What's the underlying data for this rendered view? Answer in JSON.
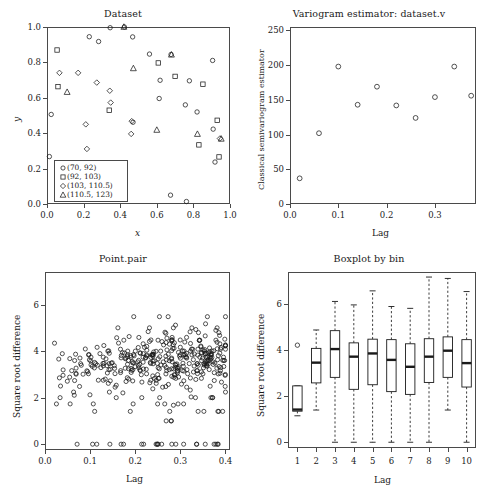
{
  "figure": {
    "width": 492,
    "height": 491,
    "background": "#ffffff",
    "ink": "#1a1a1a"
  },
  "panels": {
    "dataset": {
      "title": "Dataset",
      "xlabel": "x",
      "ylabel": "y",
      "xticks": [
        "0.0",
        "0.2",
        "0.4",
        "0.6",
        "0.8",
        "1.0"
      ],
      "yticks": [
        "0.0",
        "0.2",
        "0.4",
        "0.6",
        "0.8",
        "1.0"
      ],
      "legend_title": "",
      "legend": [
        {
          "label": "(70, 92)",
          "symbol": "circle"
        },
        {
          "label": "(92, 103)",
          "symbol": "square"
        },
        {
          "label": "(103, 110.5)",
          "symbol": "diamond"
        },
        {
          "label": "(110.5, 123)",
          "symbol": "triangle"
        }
      ]
    },
    "variogram": {
      "title": "Variogram estimator: dataset.v",
      "xlabel": "Lag",
      "ylabel": "Classical semivariogram estimator",
      "xticks": [
        "0.0",
        "0.1",
        "0.2",
        "0.3"
      ],
      "yticks": [
        "0",
        "50",
        "100",
        "150",
        "200",
        "250"
      ]
    },
    "pointpair": {
      "title": "Point.pair",
      "xlabel": "Lag",
      "ylabel": "Square root difference",
      "xticks": [
        "0.0",
        "0.1",
        "0.2",
        "0.3",
        "0.4"
      ],
      "yticks": [
        "0",
        "2",
        "4",
        "6"
      ]
    },
    "boxplot": {
      "title": "Boxplot by bin",
      "xlabel": "Lag",
      "ylabel": "Square root difference",
      "xticks": [
        "1",
        "2",
        "3",
        "4",
        "5",
        "6",
        "7",
        "8",
        "9",
        "10"
      ],
      "yticks": [
        "0",
        "2",
        "4",
        "6"
      ]
    }
  },
  "chart_data": [
    {
      "type": "scatter",
      "panel": "dataset",
      "title": "Dataset",
      "xlabel": "x",
      "ylabel": "y",
      "xlim": [
        0.0,
        1.0
      ],
      "ylim": [
        0.0,
        1.0
      ],
      "grid": false,
      "legend_position": "bottom-left",
      "series": [
        {
          "name": "(70, 92)",
          "symbol": "circle",
          "points": [
            [
              0.013,
              0.268
            ],
            [
              0.023,
              0.506
            ],
            [
              0.231,
              0.945
            ],
            [
              0.282,
              0.918
            ],
            [
              0.345,
              0.996
            ],
            [
              0.423,
              1.0
            ],
            [
              0.468,
              0.944
            ],
            [
              0.56,
              0.847
            ],
            [
              0.613,
              0.596
            ],
            [
              0.618,
              0.699
            ],
            [
              0.678,
              0.845
            ],
            [
              0.756,
              0.56
            ],
            [
              0.778,
              0.696
            ],
            [
              0.82,
              0.52
            ],
            [
              0.905,
              0.811
            ],
            [
              0.908,
              0.423
            ],
            [
              0.675,
              0.05
            ],
            [
              0.762,
              0.014
            ],
            [
              0.423,
              0.208
            ],
            [
              0.918,
              0.237
            ],
            [
              0.47,
              0.462
            ]
          ]
        },
        {
          "name": "(92, 103)",
          "symbol": "square",
          "points": [
            [
              0.055,
              0.87
            ],
            [
              0.06,
              0.663
            ],
            [
              0.34,
              0.53
            ],
            [
              0.608,
              0.797
            ],
            [
              0.7,
              0.721
            ],
            [
              0.852,
              0.677
            ],
            [
              0.83,
              0.334
            ],
            [
              0.93,
              0.473
            ],
            [
              0.94,
              0.266
            ]
          ]
        },
        {
          "name": "(103, 110.5)",
          "symbol": "diamond",
          "points": [
            [
              0.068,
              0.741
            ],
            [
              0.17,
              0.741
            ],
            [
              0.212,
              0.45
            ],
            [
              0.218,
              0.311
            ],
            [
              0.272,
              0.686
            ],
            [
              0.343,
              0.64
            ],
            [
              0.348,
              0.573
            ],
            [
              0.46,
              0.396
            ],
            [
              0.463,
              0.468
            ],
            [
              0.945,
              0.37
            ]
          ]
        },
        {
          "name": "(110.5, 123)",
          "symbol": "triangle",
          "points": [
            [
              0.11,
              0.632
            ],
            [
              0.42,
              1.0
            ],
            [
              0.472,
              0.766
            ],
            [
              0.6,
              0.418
            ],
            [
              0.68,
              0.843
            ],
            [
              0.822,
              0.395
            ],
            [
              0.952,
              0.368
            ],
            [
              0.423,
              0.19
            ]
          ]
        }
      ]
    },
    {
      "type": "scatter",
      "panel": "variogram",
      "title": "Variogram estimator: dataset.v",
      "xlabel": "Lag",
      "ylabel": "Classical semivariogram estimator",
      "xlim": [
        0.0,
        0.385
      ],
      "ylim": [
        0,
        255
      ],
      "grid": false,
      "x": [
        0.02,
        0.06,
        0.1,
        0.14,
        0.18,
        0.22,
        0.26,
        0.3,
        0.34,
        0.375
      ],
      "values": [
        37,
        102,
        198,
        143,
        169,
        142,
        124,
        154,
        198,
        156
      ]
    },
    {
      "type": "scatter",
      "panel": "pointpair",
      "title": "Point.pair",
      "xlabel": "Lag",
      "ylabel": "Square root difference",
      "xlim": [
        0.0,
        0.41
      ],
      "ylim": [
        -0.25,
        7.4
      ],
      "grid": false,
      "n_points": 420,
      "note": "dense cloud of point-pair square-root differences vs lag; median band near 3.5, values 0 to ~7.2"
    },
    {
      "type": "boxplot",
      "panel": "boxplot",
      "title": "Boxplot by bin",
      "xlabel": "Lag",
      "ylabel": "Square root difference",
      "categories": [
        "1",
        "2",
        "3",
        "4",
        "5",
        "6",
        "7",
        "8",
        "9",
        "10"
      ],
      "ylim": [
        -0.25,
        7.4
      ],
      "grid": false,
      "boxes": [
        {
          "bin": "1",
          "whisker_low": 1.15,
          "q1": 1.35,
          "median": 1.42,
          "q3": 2.45,
          "whisker_high": 2.45,
          "outliers": [
            4.22
          ]
        },
        {
          "bin": "2",
          "whisker_low": 1.4,
          "q1": 2.58,
          "median": 3.46,
          "q3": 4.08,
          "whisker_high": 4.88,
          "outliers": []
        },
        {
          "bin": "3",
          "whisker_low": 0.0,
          "q1": 2.82,
          "median": 4.05,
          "q3": 4.85,
          "whisker_high": 6.12,
          "outliers": []
        },
        {
          "bin": "4",
          "whisker_low": 0.0,
          "q1": 2.3,
          "median": 3.72,
          "q3": 4.32,
          "whisker_high": 5.97,
          "outliers": []
        },
        {
          "bin": "5",
          "whisker_low": 0.0,
          "q1": 2.5,
          "median": 3.86,
          "q3": 4.48,
          "whisker_high": 6.58,
          "outliers": []
        },
        {
          "bin": "6",
          "whisker_low": 0.0,
          "q1": 2.2,
          "median": 3.58,
          "q3": 4.46,
          "whisker_high": 5.9,
          "outliers": []
        },
        {
          "bin": "7",
          "whisker_low": 0.0,
          "q1": 2.08,
          "median": 3.28,
          "q3": 4.28,
          "whisker_high": 5.82,
          "outliers": []
        },
        {
          "bin": "8",
          "whisker_low": 0.0,
          "q1": 2.6,
          "median": 3.72,
          "q3": 4.5,
          "whisker_high": 7.18,
          "outliers": []
        },
        {
          "bin": "9",
          "whisker_low": 1.4,
          "q1": 2.82,
          "median": 3.98,
          "q3": 4.58,
          "whisker_high": 7.12,
          "outliers": []
        },
        {
          "bin": "10",
          "whisker_low": 0.0,
          "q1": 2.4,
          "median": 3.44,
          "q3": 4.46,
          "whisker_high": 6.55,
          "outliers": []
        }
      ]
    }
  ]
}
